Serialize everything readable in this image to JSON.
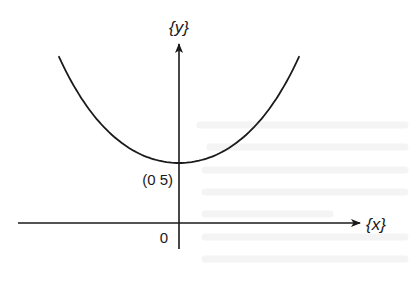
{
  "figure": {
    "type": "function-graph",
    "x_axis_label": "{x}",
    "y_axis_label": "{y}",
    "origin_label": "0",
    "minimum_point_label": "(0 5)",
    "colors": {
      "ink": "#1a1a1a",
      "background": "#ffffff"
    }
  },
  "chart_data": {
    "type": "line",
    "title": "",
    "xlabel": "{x}",
    "ylabel": "{y}",
    "annotations": [
      {
        "text": "(0 5)",
        "at": [
          0,
          5
        ],
        "note": "minimum of curve on y-axis"
      },
      {
        "text": "0",
        "at": [
          0,
          0
        ],
        "note": "origin"
      }
    ],
    "series": [
      {
        "name": "curve",
        "shape": "symmetric U-shaped (catenary-like) curve",
        "x": [
          -10,
          -8,
          -6,
          -4,
          -2,
          0,
          2,
          4,
          6,
          8,
          10
        ],
        "y": [
          19.6,
          14.0,
          10.2,
          7.6,
          5.6,
          5.0,
          5.6,
          7.6,
          10.2,
          14.0,
          19.6
        ]
      }
    ],
    "xlim": [
      -10.5,
      11.5
    ],
    "ylim": [
      -1.8,
      12.5
    ],
    "grid": false,
    "legend": "none"
  }
}
